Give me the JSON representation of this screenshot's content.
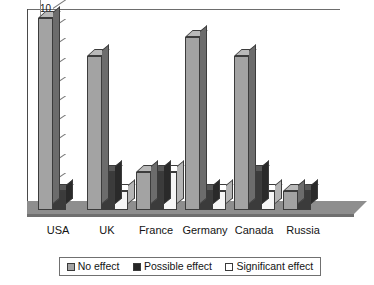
{
  "chart_data": {
    "type": "bar",
    "title": "",
    "subtitle": "",
    "xlabel": "",
    "ylabel": "",
    "categories": [
      "USA",
      "UK",
      "France",
      "Germany",
      "Canada",
      "Russia"
    ],
    "series": [
      {
        "name": "No effect",
        "color": "#a3a3a3",
        "values": [
          10,
          8,
          2,
          9,
          8,
          1
        ]
      },
      {
        "name": "Possible effect",
        "color": "#262626",
        "values": [
          1,
          2,
          2,
          1,
          2,
          1
        ]
      },
      {
        "name": "Significant effect",
        "color": "#ffffff",
        "values": [
          0,
          1,
          2,
          1,
          1,
          0
        ]
      }
    ],
    "ylim": [
      0,
      10
    ],
    "yticks": [
      0,
      1,
      2,
      3,
      4,
      5,
      6,
      7,
      8,
      9,
      10
    ],
    "ytick_labels": [
      "0",
      "1",
      "2",
      "3",
      "4",
      "5",
      "6",
      "7",
      "8",
      "9",
      "10"
    ],
    "grid": false,
    "legend_position": "bottom",
    "style": "3d-grayscale",
    "annotations": []
  },
  "legend": {
    "items": [
      {
        "label": "No effect",
        "swatch": "gray-swatch-icon"
      },
      {
        "label": "Possible effect",
        "swatch": "black-swatch-icon"
      },
      {
        "label": "Significant effect",
        "swatch": "white-swatch-icon"
      }
    ]
  }
}
